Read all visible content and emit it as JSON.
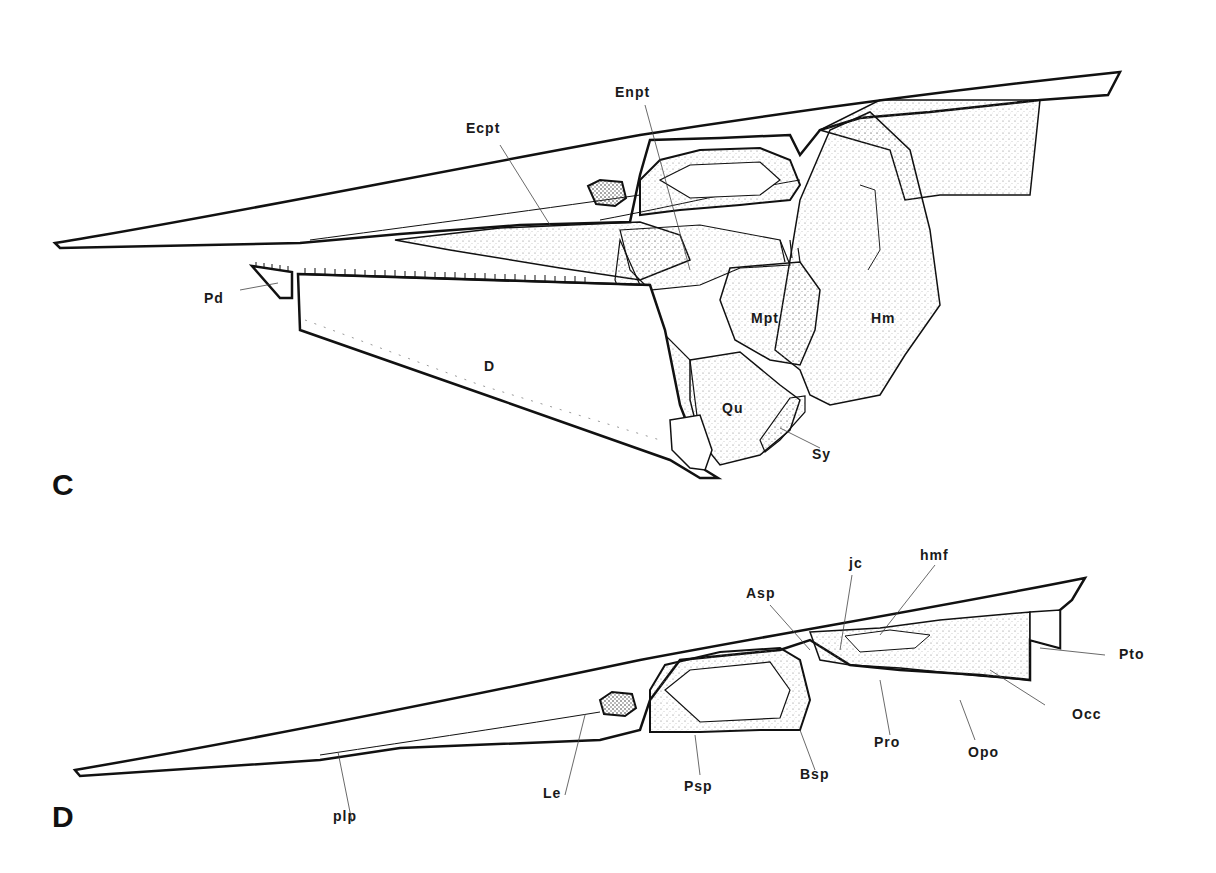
{
  "panels": [
    {
      "id": "C",
      "letter": "C",
      "labels": {
        "Ecpt": "Ecpt",
        "Enpt": "Enpt",
        "Pd": "Pd",
        "D": "D",
        "Mpt": "Mpt",
        "Hm": "Hm",
        "Qu": "Qu",
        "Sy": "Sy"
      }
    },
    {
      "id": "D",
      "letter": "D",
      "labels": {
        "Asp": "Asp",
        "jc": "jc",
        "hmf": "hmf",
        "Pto": "Pto",
        "Occ": "Occ",
        "Opo": "Opo",
        "Pro": "Pro",
        "Bsp": "Bsp",
        "Psp": "Psp",
        "Le": "Le",
        "plp": "plp"
      }
    }
  ],
  "colors": {
    "line": "#111111",
    "stipple": "#cfcfcf",
    "background": "#ffffff"
  }
}
